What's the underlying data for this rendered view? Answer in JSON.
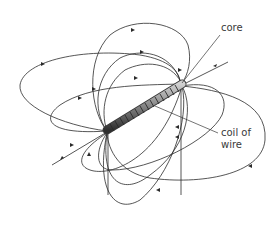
{
  "diagram": {
    "labels": {
      "core": "core",
      "coil_line1": "coil of",
      "coil_line2": "wire"
    },
    "colors": {
      "line": "#2b2b2b",
      "coil_dark": "#3c3c3c",
      "coil_light": "#b5b5b5",
      "text": "#3a3a3a",
      "background": "#ffffff"
    }
  }
}
